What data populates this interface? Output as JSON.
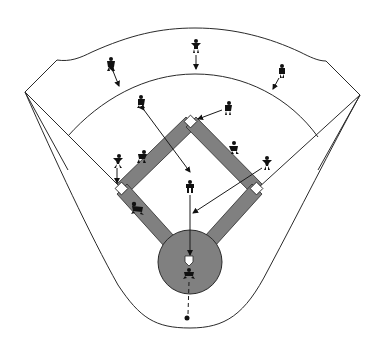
{
  "diagram": {
    "colors": {
      "background": "#ffffff",
      "lines": "#2a2a2a",
      "infield_basepaths": "#808080",
      "pitcher_mound": "#808080",
      "players": "#111111"
    },
    "bases": [
      {
        "name": "second-base",
        "x": 191,
        "y": 122
      },
      {
        "name": "third-base",
        "x": 122,
        "y": 189
      },
      {
        "name": "first-base",
        "x": 257,
        "y": 189
      },
      {
        "name": "home-plate",
        "x": 189,
        "y": 262
      }
    ],
    "players": [
      {
        "name": "left-fielder",
        "x": 111,
        "y": 64
      },
      {
        "name": "center-fielder",
        "x": 196,
        "y": 46
      },
      {
        "name": "right-fielder",
        "x": 282,
        "y": 71
      },
      {
        "name": "shortstop",
        "x": 141,
        "y": 102
      },
      {
        "name": "second-baseman",
        "x": 228,
        "y": 108
      },
      {
        "name": "third-baseman",
        "x": 118,
        "y": 161
      },
      {
        "name": "infielder-left",
        "x": 142,
        "y": 157
      },
      {
        "name": "infielder-right",
        "x": 234,
        "y": 148
      },
      {
        "name": "first-baseman",
        "x": 267,
        "y": 163
      },
      {
        "name": "pitcher",
        "x": 190,
        "y": 187
      },
      {
        "name": "runner-third-line",
        "x": 137,
        "y": 208
      },
      {
        "name": "catcher",
        "x": 189,
        "y": 274
      }
    ],
    "ball_marker": {
      "x": 187,
      "y": 318
    }
  }
}
